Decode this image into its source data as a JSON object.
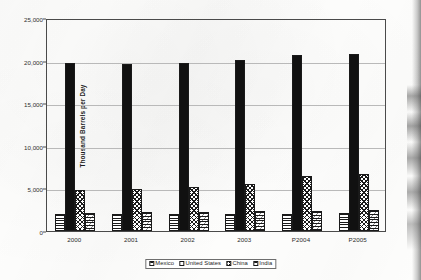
{
  "chart_data": {
    "type": "bar",
    "title": "",
    "xlabel": "",
    "ylabel": "Thousand Barrels per Day",
    "categories": [
      "2000",
      "2001",
      "2002",
      "2003",
      "P2004",
      "P2005"
    ],
    "ylim": [
      0,
      25000
    ],
    "yticks": [
      0,
      5000,
      10000,
      15000,
      20000,
      25000
    ],
    "ytick_labels": [
      "0",
      "5,000",
      "10,000",
      "15,000",
      "20,000",
      "25,000"
    ],
    "grid": true,
    "legend_position": "bottom",
    "series": [
      {
        "name": "Mexico",
        "pattern": "horizontal-lines",
        "values": [
          2000,
          2000,
          1980,
          1990,
          2020,
          2060
        ]
      },
      {
        "name": "United States",
        "pattern": "solid-black",
        "values": [
          19700,
          19650,
          19760,
          20030,
          20700,
          20780
        ]
      },
      {
        "name": "China",
        "pattern": "crosshatch",
        "values": [
          4800,
          4900,
          5150,
          5550,
          6400,
          6700
        ]
      },
      {
        "name": "India",
        "pattern": "horizontal-hatch",
        "values": [
          2110,
          2200,
          2260,
          2320,
          2400,
          2440
        ]
      }
    ]
  },
  "legend": {
    "items": [
      {
        "label": "Mexico"
      },
      {
        "label": "United States"
      },
      {
        "label": "China"
      },
      {
        "label": "India"
      }
    ]
  },
  "axis": {
    "y_title": "Thousand Barrels per Day"
  }
}
